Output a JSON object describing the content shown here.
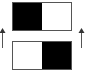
{
  "diagram": {
    "top_box": {
      "cells": [
        {
          "fill": "#000000"
        },
        {
          "fill": "#ffffff"
        }
      ]
    },
    "bottom_box": {
      "cells": [
        {
          "fill": "#ffffff"
        },
        {
          "fill": "#000000"
        }
      ]
    },
    "arrows": [
      {
        "side": "left",
        "direction": "up",
        "color": "#555555"
      },
      {
        "side": "right",
        "direction": "up",
        "color": "#555555"
      }
    ],
    "border_color": "#555555"
  }
}
